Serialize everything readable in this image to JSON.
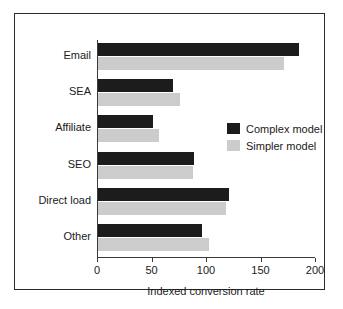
{
  "chart_data": {
    "type": "bar",
    "orientation": "horizontal",
    "title": "",
    "xlabel": "Indexed conversion rate",
    "ylabel": "",
    "xlim": [
      0,
      200
    ],
    "xticks": [
      0,
      50,
      100,
      150,
      200
    ],
    "grid": false,
    "legend_position": "center-right",
    "categories": [
      "Email",
      "SEA",
      "Affiliate",
      "SEO",
      "Direct load",
      "Other"
    ],
    "series": [
      {
        "name": "Complex model",
        "color": "#1c1c1c",
        "values": [
          184,
          69,
          50,
          88,
          120,
          95
        ]
      },
      {
        "name": "Simpler model",
        "color": "#cccccc",
        "values": [
          171,
          75,
          56,
          87,
          117,
          102
        ]
      }
    ]
  },
  "legend": {
    "items": [
      {
        "label": "Complex model"
      },
      {
        "label": "Simpler model"
      }
    ]
  },
  "axis": {
    "x_title": "Indexed conversion rate",
    "tick_labels": [
      "0",
      "50",
      "100",
      "150",
      "200"
    ]
  },
  "colors": {
    "complex_model": "#1c1c1c",
    "simpler_model": "#cccccc",
    "axis": "#3a3a3a",
    "frame": "#2b2b2b",
    "background": "#ffffff",
    "text": "#1a1a1a"
  }
}
